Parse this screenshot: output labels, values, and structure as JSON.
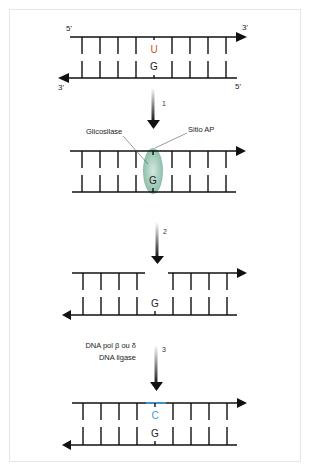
{
  "diagram": {
    "type": "base-excision-repair",
    "colors": {
      "strand": "#111111",
      "uracil": "#d0502a",
      "cytosine": "#3a9ad9",
      "enzyme": "#7fb7a0",
      "frame_border": "#e6e6e6"
    },
    "panel1": {
      "top_5prime": "5'",
      "top_3prime": "3'",
      "bottom_3prime": "3'",
      "bottom_5prime": "5'",
      "top_base": "U",
      "bottom_base": "G"
    },
    "step1": {
      "label": "1"
    },
    "panel2": {
      "enzyme_label": "Glicosilase",
      "site_label": "Sitio AP",
      "bottom_base": "G"
    },
    "step2": {
      "label": "2"
    },
    "panel3": {
      "bottom_base": "G"
    },
    "step3": {
      "label": "3",
      "enzyme_line1": "DNA pol β ou δ",
      "enzyme_line2": "DNA ligase"
    },
    "panel4": {
      "top_base": "C",
      "bottom_base": "G"
    }
  }
}
